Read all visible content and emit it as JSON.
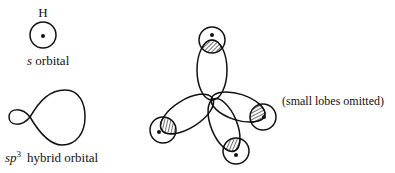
{
  "s_orbital": {
    "atom_label": "H",
    "caption_italic": "s",
    "caption_rest": " orbital"
  },
  "sp3_orbital": {
    "caption_italic": "sp",
    "caption_sup": "3",
    "caption_rest": "hybrid orbital"
  },
  "tetrahedral": {
    "note": "(small lobes omitted)",
    "hydrogen_count": 4
  },
  "colors": {
    "line": "#111111",
    "background": "#ffffff"
  }
}
